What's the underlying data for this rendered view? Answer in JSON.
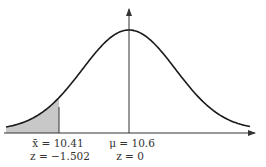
{
  "chart_data": {
    "type": "area",
    "title": "",
    "distribution": "normal",
    "mean": 10.6,
    "sample_mean": 10.41,
    "z_sample": -1.502,
    "z_mean": 0,
    "shaded_region": "left-tail",
    "labels": {
      "xbar_line": "x̄ = 10.41",
      "z_line_left": "z = −1.502",
      "mu_line": "μ = 10.6",
      "z_line_mu": "z = 0"
    },
    "colors": {
      "curve": "#1a1a1a",
      "axis": "#333333",
      "shade": "#c8c8c8"
    }
  }
}
